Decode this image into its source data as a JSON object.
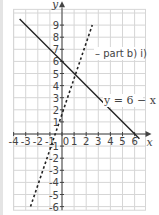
{
  "chart_data": {
    "type": "line",
    "title": "",
    "xlabel": "x",
    "ylabel": "y",
    "xlim": [
      -4,
      6.9
    ],
    "ylim": [
      -6.3,
      10.3
    ],
    "grid": true,
    "x_ticks": [
      "-4",
      "-3",
      "-2",
      "-1",
      "0",
      "1",
      "2",
      "3",
      "4",
      "5",
      "6"
    ],
    "y_ticks": [
      "-6",
      "-5",
      "-4",
      "-3",
      "-2",
      "-1",
      "1",
      "2",
      "3",
      "4",
      "5",
      "6",
      "7",
      "8",
      "9"
    ],
    "series": [
      {
        "name": "y = 6 − x",
        "style": "solid",
        "color": "#222222",
        "x": [
          -3.5,
          6.4
        ],
        "y": [
          9.5,
          -0.4
        ]
      },
      {
        "name": "part b) i)",
        "style": "dashed",
        "color": "#222222",
        "x": [
          -2.6,
          2.5
        ],
        "y": [
          -6,
          9
        ]
      }
    ],
    "annotations": [
      {
        "text": "– part b) i)",
        "x": 2.7,
        "y": 7.0
      },
      {
        "text": "y = 6 − x",
        "x": 3.4,
        "y": 3.0
      }
    ]
  },
  "labels": {
    "x_axis": "x",
    "y_axis": "y",
    "annotation_dashed": "– part b) i)",
    "annotation_solid": "y = 6 − x"
  }
}
